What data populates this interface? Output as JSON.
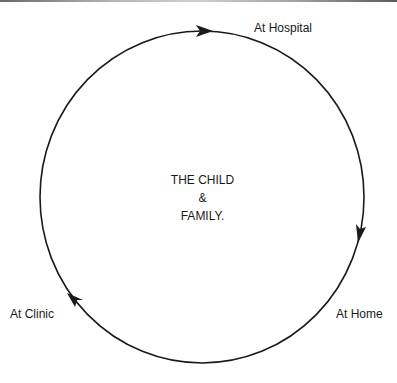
{
  "diagram": {
    "type": "cycle",
    "center": {
      "line1": "THE CHILD",
      "line2": "&",
      "line3": "FAMILY."
    },
    "nodes": [
      {
        "id": "hospital",
        "label": "At Hospital"
      },
      {
        "id": "home",
        "label": "At Home"
      },
      {
        "id": "clinic",
        "label": "At Clinic"
      }
    ],
    "flow": "clockwise",
    "edges": [
      {
        "from": "clinic",
        "to": "hospital"
      },
      {
        "from": "hospital",
        "to": "home"
      },
      {
        "from": "home",
        "to": "clinic"
      }
    ],
    "colors": {
      "stroke": "#1a1a1a",
      "text": "#1a1a1a",
      "background": "#ffffff"
    }
  }
}
